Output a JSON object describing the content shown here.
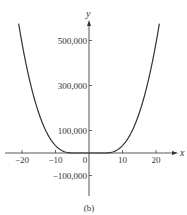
{
  "chart_data": {
    "type": "line",
    "title": "",
    "caption": "(b)",
    "xlabel": "x",
    "ylabel": "y",
    "xlim": [
      -23,
      23
    ],
    "ylim": [
      -190000,
      580000
    ],
    "grid": false,
    "legend": null,
    "x_ticks": [
      -20,
      -10,
      0,
      10,
      20
    ],
    "x_tick_labels": [
      "−20",
      "−10",
      "0",
      "10",
      "20"
    ],
    "y_ticks": [
      500000,
      300000,
      100000,
      -100000
    ],
    "y_tick_labels": [
      "500,000",
      "300,000",
      "100,000",
      "−100,000"
    ],
    "series": [
      {
        "name": "curve",
        "x": [
          -21,
          -20,
          -18,
          -16,
          -14,
          -12,
          -10,
          -8,
          -6,
          -4,
          -2,
          0,
          2,
          4,
          6,
          8,
          10,
          12,
          14,
          16,
          18,
          20,
          21
        ],
        "values": [
          575000,
          480000,
          315000,
          195000,
          115000,
          60000,
          27000,
          9000,
          2000,
          0,
          0,
          0,
          0,
          0,
          2000,
          9000,
          27000,
          60000,
          115000,
          195000,
          315000,
          480000,
          575000
        ]
      }
    ]
  },
  "plot": {
    "origin_px": [
      89,
      153
    ],
    "x_px_per_unit": 3.35,
    "y_px_per_100000": 22.5
  }
}
